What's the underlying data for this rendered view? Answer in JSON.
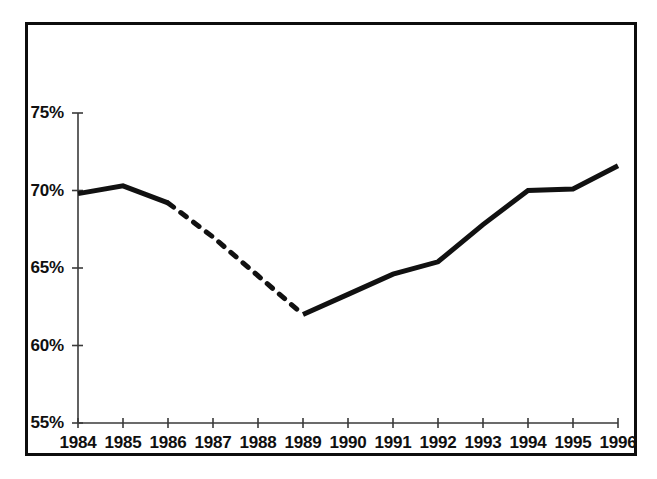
{
  "figure": {
    "background_color": "#ffffff",
    "frame_color": "#0d0d0d",
    "axis_color": "#3a3a3a",
    "line_color": "#111111"
  },
  "chart_data": {
    "type": "line",
    "title": "",
    "subtitle": "",
    "xlabel": "",
    "ylabel": "",
    "x": [
      1984,
      1985,
      1986,
      1987,
      1988,
      1989,
      1990,
      1991,
      1992,
      1993,
      1994,
      1995,
      1996
    ],
    "categories": [
      "1984",
      "1985",
      "1986",
      "1987",
      "1988",
      "1989",
      "1990",
      "1991",
      "1992",
      "1993",
      "1994",
      "1995",
      "1996"
    ],
    "values": [
      69.8,
      70.3,
      69.2,
      67.0,
      64.5,
      62.0,
      63.3,
      64.6,
      65.4,
      67.8,
      70.0,
      70.1,
      71.6
    ],
    "series": [
      {
        "name": "percent",
        "values": [
          69.8,
          70.3,
          69.2,
          67.0,
          64.5,
          62.0,
          63.3,
          64.6,
          65.4,
          67.8,
          70.0,
          70.1,
          71.6
        ],
        "segments": [
          {
            "style": "solid",
            "from_index": 0,
            "to_index": 2
          },
          {
            "style": "dashed",
            "from_index": 2,
            "to_index": 5
          },
          {
            "style": "solid",
            "from_index": 5,
            "to_index": 12
          }
        ]
      }
    ],
    "ylim": [
      55,
      75
    ],
    "xlim": [
      1984,
      1996
    ],
    "y_ticks": [
      55,
      60,
      65,
      70,
      75
    ],
    "y_tick_labels": [
      "55%",
      "60%",
      "65%",
      "70%",
      "75%"
    ],
    "x_ticks": [
      1984,
      1985,
      1986,
      1987,
      1988,
      1989,
      1990,
      1991,
      1992,
      1993,
      1994,
      1995,
      1996
    ],
    "x_tick_labels": [
      "1984",
      "1985",
      "1986",
      "1987",
      "1988",
      "1989",
      "1990",
      "1991",
      "1992",
      "1993",
      "1994",
      "1995",
      "1996"
    ],
    "grid": false,
    "legend": null,
    "legend_position": "none",
    "annotations": []
  }
}
